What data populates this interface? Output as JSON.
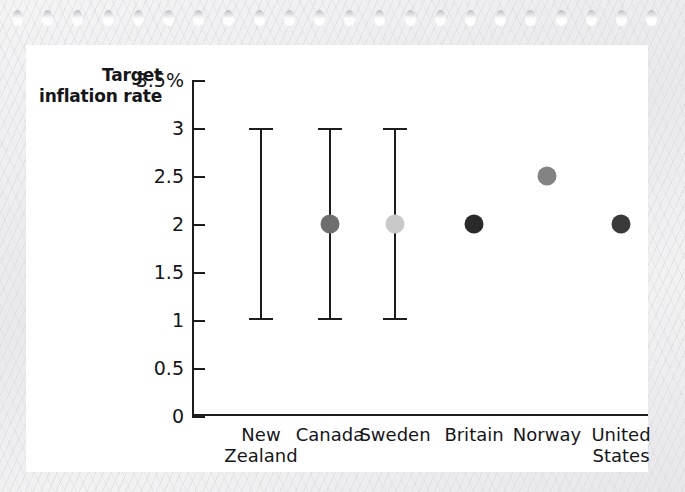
{
  "page": {
    "background_color": "#ececed",
    "card_color": "#ffffff",
    "punch_hole_count": 22
  },
  "chart_data": {
    "type": "scatter",
    "title": "Target\ninflation\nrate",
    "xlabel": "",
    "ylabel": "",
    "ylim": [
      0,
      3.5
    ],
    "grid": false,
    "legend": "none",
    "y_ticks": [
      {
        "value": 3.5,
        "label": "3.5%"
      },
      {
        "value": 3,
        "label": "3"
      },
      {
        "value": 2.5,
        "label": "2.5"
      },
      {
        "value": 2,
        "label": "2"
      },
      {
        "value": 1.5,
        "label": "1.5"
      },
      {
        "value": 1,
        "label": "1"
      },
      {
        "value": 0.5,
        "label": "0.5"
      },
      {
        "value": 0,
        "label": "0"
      }
    ],
    "categories": [
      "New\nZealand",
      "Canada",
      "Sweden",
      "Britain",
      "Norway",
      "United\nStates"
    ],
    "points": [
      {
        "category": "New Zealand",
        "target": null,
        "range_low": 1,
        "range_high": 3,
        "dot_color": null
      },
      {
        "category": "Canada",
        "target": 2,
        "range_low": 1,
        "range_high": 3,
        "dot_color": "#6e6e6e"
      },
      {
        "category": "Sweden",
        "target": 2,
        "range_low": 1,
        "range_high": 3,
        "dot_color": "#c9c9c9"
      },
      {
        "category": "Britain",
        "target": 2,
        "range_low": null,
        "range_high": null,
        "dot_color": "#2a2a2a"
      },
      {
        "category": "Norway",
        "target": 2.5,
        "range_low": null,
        "range_high": null,
        "dot_color": "#838383"
      },
      {
        "category": "United States",
        "target": 2,
        "range_low": null,
        "range_high": null,
        "dot_color": "#3a3a3a"
      }
    ]
  }
}
